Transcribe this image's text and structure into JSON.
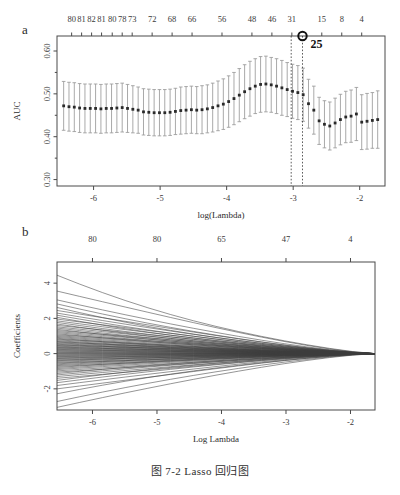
{
  "figure": {
    "caption": "图 7-2   Lasso 回归图",
    "panel_a_label": "a",
    "panel_b_label": "b"
  },
  "chart_data": [
    {
      "type": "line",
      "id": "panel-a",
      "title": "",
      "xlabel": "log(Lambda)",
      "ylabel": "AUC",
      "xlim": [
        -6.55,
        -1.62
      ],
      "ylim": [
        0.285,
        0.635
      ],
      "xticks": [
        -6,
        -5,
        -4,
        -3,
        -2
      ],
      "xticklabels": [
        "-6",
        "-5",
        "-4",
        "-3",
        "-2"
      ],
      "yticks": [
        0.3,
        0.4,
        0.5,
        0.6
      ],
      "yticklabels": [
        "0.30",
        "0.40",
        "0.50",
        "0.60"
      ],
      "grid": false,
      "top_axis_label": "",
      "top_axis_ticklabels": [
        "80",
        "81",
        "82",
        "81",
        "80",
        "78",
        "73",
        "72",
        "68",
        "66",
        "56",
        "48",
        "46",
        "31",
        "15",
        "8",
        "4"
      ],
      "top_axis_tickvalues": [
        -6.33,
        -6.18,
        -6.03,
        -5.88,
        -5.72,
        -5.57,
        -5.42,
        -5.12,
        -4.82,
        -4.52,
        -4.07,
        -3.62,
        -3.32,
        -3.02,
        -2.57,
        -2.27,
        -1.97
      ],
      "annotation": {
        "text": "25",
        "x": -2.86,
        "y": 0.635,
        "marker": "circle"
      },
      "vlines": [
        -3.03,
        -2.86
      ],
      "x": [
        -6.45,
        -6.37,
        -6.29,
        -6.21,
        -6.13,
        -6.05,
        -5.97,
        -5.89,
        -5.81,
        -5.73,
        -5.65,
        -5.57,
        -5.49,
        -5.41,
        -5.33,
        -5.25,
        -5.17,
        -5.09,
        -5.01,
        -4.93,
        -4.85,
        -4.77,
        -4.69,
        -4.61,
        -4.53,
        -4.45,
        -4.37,
        -4.29,
        -4.21,
        -4.13,
        -4.05,
        -3.97,
        -3.89,
        -3.81,
        -3.73,
        -3.65,
        -3.57,
        -3.49,
        -3.41,
        -3.33,
        -3.25,
        -3.17,
        -3.09,
        -3.01,
        -2.93,
        -2.85,
        -2.77,
        -2.69,
        -2.61,
        -2.53,
        -2.45,
        -2.37,
        -2.29,
        -2.21,
        -2.13,
        -2.05,
        -1.97,
        -1.89,
        -1.81,
        -1.73
      ],
      "series": [
        {
          "name": "AUC (mean)",
          "values": [
            0.472,
            0.47,
            0.469,
            0.467,
            0.466,
            0.466,
            0.466,
            0.465,
            0.466,
            0.466,
            0.467,
            0.468,
            0.466,
            0.464,
            0.462,
            0.458,
            0.457,
            0.456,
            0.456,
            0.456,
            0.457,
            0.459,
            0.461,
            0.462,
            0.463,
            0.462,
            0.463,
            0.465,
            0.468,
            0.472,
            0.476,
            0.482,
            0.489,
            0.497,
            0.505,
            0.512,
            0.518,
            0.522,
            0.523,
            0.521,
            0.518,
            0.514,
            0.51,
            0.506,
            0.503,
            0.498,
            0.477,
            0.462,
            0.437,
            0.429,
            0.425,
            0.432,
            0.44,
            0.446,
            0.448,
            0.453,
            0.434,
            0.436,
            0.438,
            0.44
          ],
          "upper": [
            0.529,
            0.527,
            0.526,
            0.524,
            0.523,
            0.523,
            0.523,
            0.522,
            0.523,
            0.523,
            0.524,
            0.525,
            0.522,
            0.519,
            0.516,
            0.512,
            0.511,
            0.51,
            0.51,
            0.51,
            0.511,
            0.513,
            0.516,
            0.517,
            0.518,
            0.517,
            0.519,
            0.521,
            0.525,
            0.53,
            0.535,
            0.542,
            0.55,
            0.559,
            0.568,
            0.576,
            0.582,
            0.587,
            0.588,
            0.585,
            0.582,
            0.578,
            0.573,
            0.569,
            0.566,
            0.56,
            0.534,
            0.518,
            0.492,
            0.484,
            0.481,
            0.49,
            0.499,
            0.506,
            0.509,
            0.515,
            0.498,
            0.501,
            0.503,
            0.507
          ],
          "lower": [
            0.415,
            0.413,
            0.412,
            0.41,
            0.409,
            0.409,
            0.409,
            0.408,
            0.409,
            0.409,
            0.41,
            0.411,
            0.41,
            0.409,
            0.408,
            0.404,
            0.403,
            0.402,
            0.402,
            0.402,
            0.403,
            0.405,
            0.406,
            0.407,
            0.408,
            0.407,
            0.407,
            0.409,
            0.411,
            0.414,
            0.417,
            0.422,
            0.428,
            0.435,
            0.442,
            0.448,
            0.454,
            0.457,
            0.458,
            0.457,
            0.454,
            0.45,
            0.447,
            0.443,
            0.44,
            0.436,
            0.42,
            0.406,
            0.382,
            0.374,
            0.369,
            0.374,
            0.381,
            0.386,
            0.387,
            0.391,
            0.37,
            0.371,
            0.373,
            0.373
          ]
        }
      ]
    },
    {
      "type": "line",
      "id": "panel-b",
      "title": "",
      "xlabel": "Log Lambda",
      "ylabel": "Coefficients",
      "xlim": [
        -6.55,
        -1.62
      ],
      "ylim": [
        -3.2,
        5.2
      ],
      "xticks": [
        -6,
        -5,
        -4,
        -3,
        -2
      ],
      "xticklabels": [
        "-6",
        "-5",
        "-4",
        "-3",
        "-2"
      ],
      "yticks": [
        -2,
        0,
        2,
        4
      ],
      "yticklabels": [
        "-2",
        "0",
        "2",
        "4"
      ],
      "grid": false,
      "top_axis_ticklabels": [
        "80",
        "80",
        "65",
        "47",
        "4"
      ],
      "top_axis_tickvalues": [
        -6.0,
        -5.0,
        -4.0,
        -3.0,
        -2.0
      ],
      "n_paths": 82,
      "description": "Lasso coefficient shrinkage paths converging to zero as log lambda increases",
      "path_start_values": [
        4.45,
        3.55,
        3.05,
        2.82,
        2.62,
        2.45,
        2.3,
        2.18,
        2.06,
        1.96,
        1.86,
        1.77,
        1.68,
        1.6,
        1.52,
        1.45,
        1.38,
        1.31,
        1.25,
        1.19,
        1.13,
        1.07,
        1.02,
        0.97,
        0.92,
        0.87,
        0.82,
        0.78,
        0.73,
        0.69,
        0.65,
        0.61,
        0.57,
        0.53,
        0.49,
        0.46,
        0.42,
        0.38,
        0.35,
        0.31,
        0.28,
        0.24,
        0.21,
        0.17,
        0.14,
        0.1,
        0.07,
        0.03,
        0.0,
        -0.03,
        -0.07,
        -0.1,
        -0.14,
        -0.17,
        -0.21,
        -0.25,
        -0.28,
        -0.32,
        -0.36,
        -0.4,
        -0.44,
        -0.49,
        -0.53,
        -0.58,
        -0.63,
        -0.68,
        -0.73,
        -0.79,
        -0.85,
        -0.91,
        -0.98,
        -1.05,
        -1.13,
        -1.21,
        -1.3,
        -1.4,
        -1.52,
        -1.65,
        -1.81,
        -2.0,
        -2.28,
        -2.72,
        -3.05
      ]
    }
  ]
}
